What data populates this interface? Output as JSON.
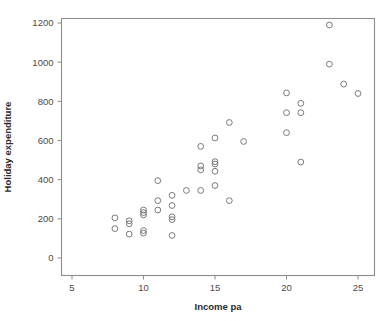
{
  "chart_data": {
    "type": "scatter",
    "title": "",
    "xlabel": "Income pa",
    "ylabel": "Holiday expenditure",
    "xlim": [
      4.0,
      26.4
    ],
    "ylim": [
      -90,
      1265
    ],
    "xticks": [
      5,
      10,
      15,
      20,
      25
    ],
    "xtick_labels": [
      "5",
      "10",
      "15",
      "20",
      "25"
    ],
    "yticks": [
      0,
      200,
      400,
      600,
      800,
      1000,
      1200
    ],
    "ytick_labels": [
      "0",
      "200",
      "400",
      "600",
      "800",
      "1000",
      "1200"
    ],
    "grid": false,
    "legend": null,
    "marker": "open-circle",
    "marker_color": "#7a7a7a",
    "frame_color": "#8d8d8d",
    "background": "#ffffff",
    "n_points": 41,
    "points": [
      {
        "x": 8,
        "y": 205
      },
      {
        "x": 8,
        "y": 150
      },
      {
        "x": 9,
        "y": 190
      },
      {
        "x": 9,
        "y": 175
      },
      {
        "x": 9,
        "y": 122
      },
      {
        "x": 10,
        "y": 245
      },
      {
        "x": 10,
        "y": 232
      },
      {
        "x": 10,
        "y": 220
      },
      {
        "x": 10,
        "y": 140
      },
      {
        "x": 10,
        "y": 127
      },
      {
        "x": 11,
        "y": 395
      },
      {
        "x": 11,
        "y": 293
      },
      {
        "x": 11,
        "y": 245
      },
      {
        "x": 12,
        "y": 320
      },
      {
        "x": 12,
        "y": 268
      },
      {
        "x": 12,
        "y": 210
      },
      {
        "x": 12,
        "y": 196
      },
      {
        "x": 12,
        "y": 115
      },
      {
        "x": 13,
        "y": 345
      },
      {
        "x": 14,
        "y": 570
      },
      {
        "x": 14,
        "y": 470
      },
      {
        "x": 14,
        "y": 450
      },
      {
        "x": 14,
        "y": 345
      },
      {
        "x": 15,
        "y": 613
      },
      {
        "x": 15,
        "y": 492
      },
      {
        "x": 15,
        "y": 480
      },
      {
        "x": 15,
        "y": 443
      },
      {
        "x": 15,
        "y": 370
      },
      {
        "x": 16,
        "y": 692
      },
      {
        "x": 16,
        "y": 293
      },
      {
        "x": 17,
        "y": 595
      },
      {
        "x": 20,
        "y": 843
      },
      {
        "x": 20,
        "y": 742
      },
      {
        "x": 20,
        "y": 640
      },
      {
        "x": 21,
        "y": 790
      },
      {
        "x": 21,
        "y": 742
      },
      {
        "x": 21,
        "y": 490
      },
      {
        "x": 23,
        "y": 1190
      },
      {
        "x": 23,
        "y": 990
      },
      {
        "x": 24,
        "y": 888
      },
      {
        "x": 25,
        "y": 840
      }
    ]
  }
}
